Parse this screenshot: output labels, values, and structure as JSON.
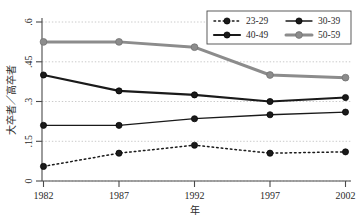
{
  "chart_data": {
    "type": "line",
    "title": "",
    "subtitle": "",
    "xlabel": "年",
    "ylabel": "大卒者／高卒者",
    "x": [
      1982,
      1987,
      1992,
      1997,
      2002
    ],
    "categories": [
      "1982",
      "1987",
      "1992",
      "1997",
      "2002"
    ],
    "xtick_labels": [
      "1982",
      "1987",
      "1992",
      "1997",
      "2002"
    ],
    "ytick_labels": [
      "0",
      ".15",
      ".3",
      ".45",
      ".6"
    ],
    "ytick_values": [
      0,
      0.15,
      0.3,
      0.45,
      0.6
    ],
    "xlim": [
      1982,
      2002
    ],
    "ylim": [
      0,
      0.6
    ],
    "grid": "horizontal-dotted",
    "legend_position": "top-right",
    "series": [
      {
        "name": "23-29",
        "values": [
          0.055,
          0.105,
          0.135,
          0.105,
          0.11
        ],
        "color": "#1a1a1a",
        "line_style": "dotted",
        "line_width": 1.5,
        "marker": "circle"
      },
      {
        "name": "30-39",
        "values": [
          0.21,
          0.21,
          0.235,
          0.25,
          0.26
        ],
        "color": "#1a1a1a",
        "line_style": "solid",
        "line_width": 1.3,
        "marker": "circle"
      },
      {
        "name": "40-49",
        "values": [
          0.4,
          0.34,
          0.325,
          0.3,
          0.315
        ],
        "color": "#1a1a1a",
        "line_style": "solid",
        "line_width": 2.2,
        "marker": "circle"
      },
      {
        "name": "50-59",
        "values": [
          0.525,
          0.525,
          0.505,
          0.4,
          0.39
        ],
        "color": "#8c8c8c",
        "line_style": "solid",
        "line_width": 3.0,
        "marker": "circle"
      }
    ]
  },
  "axes": {
    "y_label": "大卒者／高卒者",
    "x_label": "年",
    "y_ticks": [
      "0",
      ".15",
      ".3",
      ".45",
      ".6"
    ],
    "x_ticks": [
      "1982",
      "1987",
      "1992",
      "1997",
      "2002"
    ]
  },
  "legend": {
    "entries": [
      {
        "label": "23-29"
      },
      {
        "label": "30-39"
      },
      {
        "label": "40-49"
      },
      {
        "label": "50-59"
      }
    ]
  },
  "colors": {
    "series_dark": "#1a1a1a",
    "series_gray": "#8c8c8c",
    "axis": "#4a4a4a",
    "grid": "#bdbdbd",
    "background": "#ffffff"
  }
}
